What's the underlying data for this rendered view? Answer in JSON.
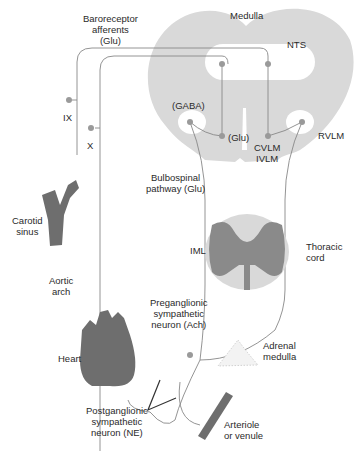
{
  "labels": {
    "baroreceptor_1": "Baroreceptor",
    "baroreceptor_2": "afferents",
    "baroreceptor_3": "(Glu)",
    "medulla": "Medulla",
    "nts": "NTS",
    "gaba": "(GABA)",
    "glu": "(Glu)",
    "cvlm": "CVLM",
    "ivlm": "IVLM",
    "rvlm": "RVLM",
    "ix": "IX",
    "x": "X",
    "bulbospinal_1": "Bulbospinal",
    "bulbospinal_2": "pathway (Glu)",
    "carotid_1": "Carotid",
    "carotid_2": "sinus",
    "iml": "IML",
    "thoracic_1": "Thoracic",
    "thoracic_2": "cord",
    "aortic_1": "Aortic",
    "aortic_2": "arch",
    "pregang_1": "Preganglionic",
    "pregang_2": "sympathetic",
    "pregang_3": "neuron (Ach)",
    "heart": "Heart",
    "adrenal_1": "Adrenal",
    "adrenal_2": "medulla",
    "postgang_1": "Postganglionic",
    "postgang_2": "sympathetic",
    "postgang_3": "neuron (NE)",
    "arteriole_1": "Arteriole",
    "arteriole_2": "or venule"
  },
  "colors": {
    "tissue_light": "#d9d9d9",
    "tissue_dark": "#8a8a8a",
    "organ": "#6e6e6e",
    "neuron_dot": "#9a9a9a",
    "line": "#888888"
  }
}
